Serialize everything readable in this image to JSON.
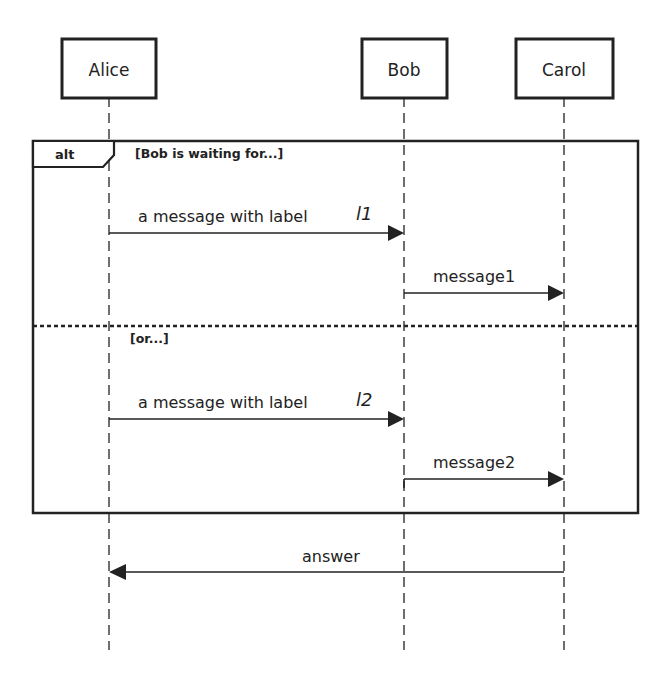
{
  "diagram": {
    "type": "sequence-diagram",
    "actors": [
      {
        "id": "alice",
        "name": "Alice"
      },
      {
        "id": "bob",
        "name": "Bob"
      },
      {
        "id": "carol",
        "name": "Carol"
      }
    ],
    "fragment": {
      "operator": "alt",
      "operands": [
        {
          "guard": "[Bob is waiting for...]"
        },
        {
          "guard": "[or...]"
        }
      ]
    },
    "messages": [
      {
        "from": "alice",
        "to": "bob",
        "text": "a message with label",
        "label": "l1",
        "operand": 0
      },
      {
        "from": "bob",
        "to": "carol",
        "text": "message1",
        "label": "",
        "operand": 0
      },
      {
        "from": "alice",
        "to": "bob",
        "text": "a message with label",
        "label": "l2",
        "operand": 1
      },
      {
        "from": "bob",
        "to": "carol",
        "text": "message2",
        "label": "",
        "operand": 1
      },
      {
        "from": "carol",
        "to": "alice",
        "text": "answer",
        "label": "",
        "operand": null
      }
    ]
  }
}
